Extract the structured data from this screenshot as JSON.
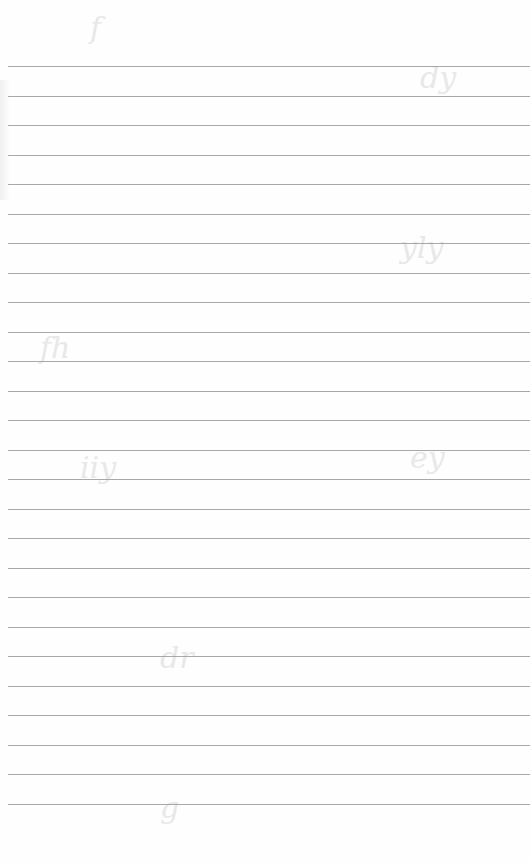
{
  "document": {
    "type": "blank lined notebook page",
    "ruled_line_count": 26,
    "handwritten_text": "",
    "line_color": "#9a9a9a",
    "paper_color": "#fefefe"
  }
}
